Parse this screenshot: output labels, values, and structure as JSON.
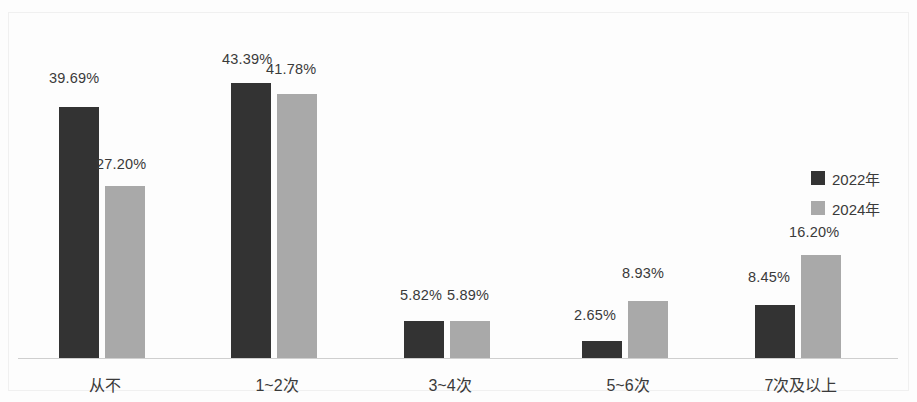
{
  "chart_data": {
    "type": "bar",
    "title": "",
    "subtitle": "",
    "xlabel": "",
    "ylabel": "",
    "grid": false,
    "axis_visible": {
      "x": true,
      "y": false
    },
    "ylim": [
      0,
      50
    ],
    "categories": [
      "从不",
      "1~2次",
      "3~4次",
      "5~6次",
      "7次及以上"
    ],
    "legend_position": "right",
    "series": [
      {
        "name": "2022年",
        "color": "#333333",
        "values": [
          39.69,
          43.39,
          5.82,
          2.65,
          8.45
        ],
        "labels": [
          "39.69%",
          "43.39%",
          "5.82%",
          "2.65%",
          "8.45%"
        ]
      },
      {
        "name": "2024年",
        "color": "#a9a9a9",
        "values": [
          27.2,
          41.78,
          5.89,
          8.93,
          16.2
        ],
        "labels": [
          "27.20%",
          "41.78%",
          "5.89%",
          "8.93%",
          "16.20%"
        ]
      }
    ]
  },
  "legend": {
    "items": [
      {
        "label": "2022年",
        "color": "#333333"
      },
      {
        "label": "2024年",
        "color": "#a9a9a9"
      }
    ]
  },
  "axis": {
    "categories": [
      {
        "label": "从不"
      },
      {
        "label": "1~2次"
      },
      {
        "label": "3~4次"
      },
      {
        "label": "5~6次"
      },
      {
        "label": "7次及以上"
      }
    ]
  },
  "layout": {
    "baseline_y": 358,
    "px_per_unit": 6.33,
    "bar_width": 40,
    "group_left_x": [
      59,
      231,
      404,
      582,
      755
    ],
    "pair_gap": 6,
    "labels": {
      "g1_2022": {
        "x": 49,
        "y": 70
      },
      "g1_2024": {
        "x": 96,
        "y": 156
      },
      "g2_2022": {
        "x": 222,
        "y": 51
      },
      "g2_2024": {
        "x": 266,
        "y": 61
      },
      "g3_2022": {
        "x": 400,
        "y": 287
      },
      "g3_2024": {
        "x": 447,
        "y": 287
      },
      "g4_2022": {
        "x": 574,
        "y": 307
      },
      "g4_2024": {
        "x": 622,
        "y": 265
      },
      "g5_2022": {
        "x": 748,
        "y": 269
      },
      "g5_2024": {
        "x": 789,
        "y": 224
      }
    },
    "cat_label_y": 372,
    "cat_label_cx": [
      105,
      277,
      450,
      628,
      801
    ]
  }
}
